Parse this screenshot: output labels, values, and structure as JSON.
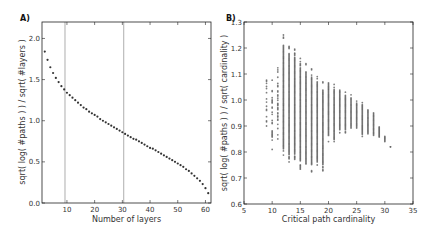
{
  "figure": {
    "panels": [
      {
        "id": "A",
        "label": "A)",
        "xlabel": "Number of layers",
        "ylabel": "sqrt( log( #paths ) ) / sqrt( #layers )",
        "xticks": [
          10,
          20,
          30,
          40,
          50,
          60
        ],
        "yticks": [
          "0.0",
          "0.5",
          "1.0",
          "1.5",
          "2.0"
        ]
      },
      {
        "id": "B",
        "label": "B)",
        "xlabel": "Critical path cardinality",
        "ylabel": "sqrt( log( #paths ) ) / sqrt( cardinality )",
        "xticks": [
          "5",
          "10",
          "15",
          "20",
          "25",
          "30",
          "35"
        ],
        "yticks": [
          "0.6",
          "0.7",
          "0.8",
          "0.9",
          "1.0",
          "1.1",
          "1.2",
          "1.3"
        ]
      }
    ]
  },
  "chart_data": [
    {
      "type": "scatter",
      "title": "A)",
      "xlabel": "Number of layers",
      "ylabel": "sqrt( log( #paths ) ) / sqrt( #layers )",
      "xlim": [
        1,
        62
      ],
      "ylim": [
        0,
        2.2
      ],
      "xticks": [
        10,
        20,
        30,
        40,
        50,
        60
      ],
      "yticks": [
        0.0,
        0.5,
        1.0,
        1.5,
        2.0
      ],
      "grid": false,
      "vlines": [
        9.3,
        30.5
      ],
      "marker_color": "#333333",
      "x": [
        2,
        3,
        4,
        5,
        6,
        7,
        8,
        9,
        10,
        11,
        12,
        13,
        14,
        15,
        16,
        17,
        18,
        19,
        20,
        21,
        22,
        23,
        24,
        25,
        26,
        27,
        28,
        29,
        30,
        31,
        32,
        33,
        34,
        35,
        36,
        37,
        38,
        39,
        40,
        41,
        42,
        43,
        44,
        45,
        46,
        47,
        48,
        49,
        50,
        51,
        52,
        53,
        54,
        55,
        56,
        57,
        58,
        59,
        60,
        61
      ],
      "y": [
        1.84,
        1.74,
        1.65,
        1.58,
        1.52,
        1.47,
        1.42,
        1.38,
        1.34,
        1.31,
        1.28,
        1.25,
        1.22,
        1.19,
        1.16,
        1.14,
        1.11,
        1.09,
        1.07,
        1.05,
        1.02,
        1.0,
        0.98,
        0.96,
        0.94,
        0.92,
        0.9,
        0.88,
        0.86,
        0.84,
        0.82,
        0.8,
        0.78,
        0.77,
        0.75,
        0.73,
        0.71,
        0.69,
        0.67,
        0.66,
        0.64,
        0.62,
        0.6,
        0.58,
        0.56,
        0.54,
        0.52,
        0.5,
        0.48,
        0.46,
        0.44,
        0.41,
        0.39,
        0.36,
        0.33,
        0.3,
        0.27,
        0.23,
        0.18,
        0.12
      ]
    },
    {
      "type": "scatter",
      "title": "B)",
      "xlabel": "Critical path cardinality",
      "ylabel": "sqrt( log( #paths ) ) / sqrt( cardinality )",
      "xlim": [
        5,
        35
      ],
      "ylim": [
        0.6,
        1.3
      ],
      "xticks": [
        5,
        10,
        15,
        20,
        25,
        30,
        35
      ],
      "yticks": [
        0.6,
        0.7,
        0.8,
        0.9,
        1.0,
        1.1,
        1.2,
        1.3
      ],
      "grid": false,
      "marker_color": "#555555",
      "columns": [
        {
          "x": 9,
          "ymin": 0.88,
          "ymax": 1.1
        },
        {
          "x": 10,
          "ymin": 0.81,
          "ymax": 1.1
        },
        {
          "x": 11,
          "ymin": 0.83,
          "ymax": 1.16
        },
        {
          "x": 12,
          "ymin": 0.78,
          "ymax": 1.25
        },
        {
          "x": 13,
          "ymin": 0.75,
          "ymax": 1.21
        },
        {
          "x": 14,
          "ymin": 0.76,
          "ymax": 1.2
        },
        {
          "x": 15,
          "ymin": 0.73,
          "ymax": 1.16
        },
        {
          "x": 16,
          "ymin": 0.73,
          "ymax": 1.14
        },
        {
          "x": 17,
          "ymin": 0.72,
          "ymax": 1.12
        },
        {
          "x": 18,
          "ymin": 0.75,
          "ymax": 1.09
        },
        {
          "x": 19,
          "ymin": 0.72,
          "ymax": 1.07
        },
        {
          "x": 20,
          "ymin": 0.84,
          "ymax": 1.09
        },
        {
          "x": 21,
          "ymin": 0.84,
          "ymax": 1.06
        },
        {
          "x": 22,
          "ymin": 0.87,
          "ymax": 1.05
        },
        {
          "x": 23,
          "ymin": 0.87,
          "ymax": 1.03
        },
        {
          "x": 24,
          "ymin": 0.88,
          "ymax": 1.02
        },
        {
          "x": 25,
          "ymin": 0.88,
          "ymax": 1.0
        },
        {
          "x": 26,
          "ymin": 0.86,
          "ymax": 0.99
        },
        {
          "x": 27,
          "ymin": 0.87,
          "ymax": 0.97
        },
        {
          "x": 28,
          "ymin": 0.86,
          "ymax": 0.95
        },
        {
          "x": 29,
          "ymin": 0.85,
          "ymax": 0.9
        },
        {
          "x": 30,
          "ymin": 0.84,
          "ymax": 0.86
        },
        {
          "x": 31,
          "ymin": 0.82,
          "ymax": 0.82
        }
      ]
    }
  ]
}
